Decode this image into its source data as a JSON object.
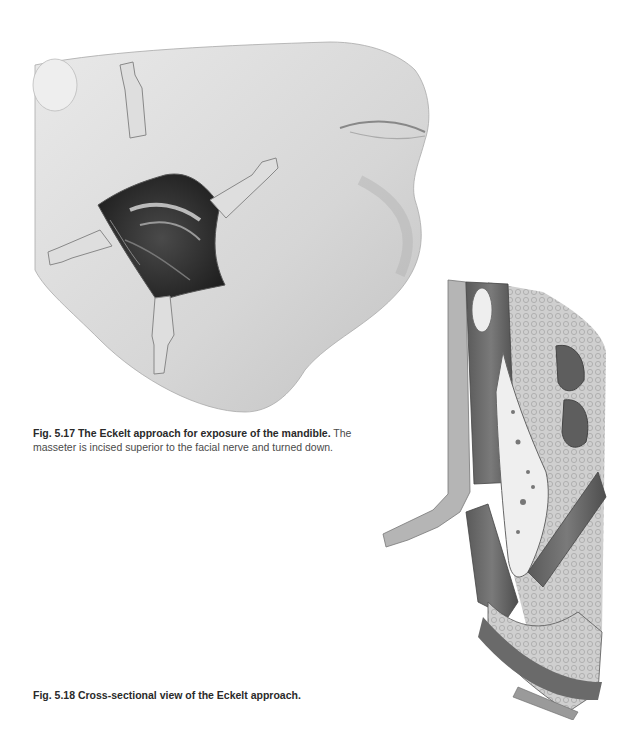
{
  "figures": [
    {
      "id": "fig-5-17",
      "label": "Fig. 5.17",
      "title": "The Eckelt approach for exposure of the mandible.",
      "body": "The masseter is incised superior to the facial nerve and turned down.",
      "illustration": "surgical-cheek-incision-with-four-retractors"
    },
    {
      "id": "fig-5-18",
      "label": "Fig. 5.18",
      "title": "Cross-sectional view of the Eckelt approach.",
      "body": "",
      "illustration": "cross-section-mandible-masseter-layers"
    }
  ],
  "colors": {
    "skin_light": "#e6e6e6",
    "skin_shadow": "#b8b8b8",
    "wound_dark": "#2b2b2b",
    "retractor": "#dcdcdc",
    "muscle": "#6e6e6e",
    "bone": "#efefef",
    "text": "#4a4a4a"
  }
}
